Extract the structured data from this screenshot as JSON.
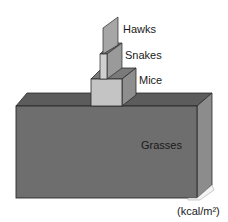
{
  "diagram": {
    "type": "pyramid of energy",
    "units": "(kcal/m²)",
    "levels": [
      {
        "name": "Hawks",
        "label": "Hawks",
        "order": 4
      },
      {
        "name": "Snakes",
        "label": "Snakes",
        "order": 3
      },
      {
        "name": "Mice",
        "label": "Mice",
        "order": 2
      },
      {
        "name": "Grasses",
        "label": "Grasses",
        "order": 1
      }
    ]
  },
  "colors": {
    "background": "#ffffff",
    "grasses_front": "#6e6e6e",
    "grasses_top": "#5c5c5c",
    "grasses_side": "#8c8c8c",
    "mice_front": "#c4c4c4",
    "mice_top": "#7a7a7a",
    "mice_side": "#8e8e8e",
    "snakes_front": "#d0d0d0",
    "snakes_side": "#9a9a9a",
    "hawks_face": "#a6a6a6",
    "edge": "#2a2a2a"
  }
}
